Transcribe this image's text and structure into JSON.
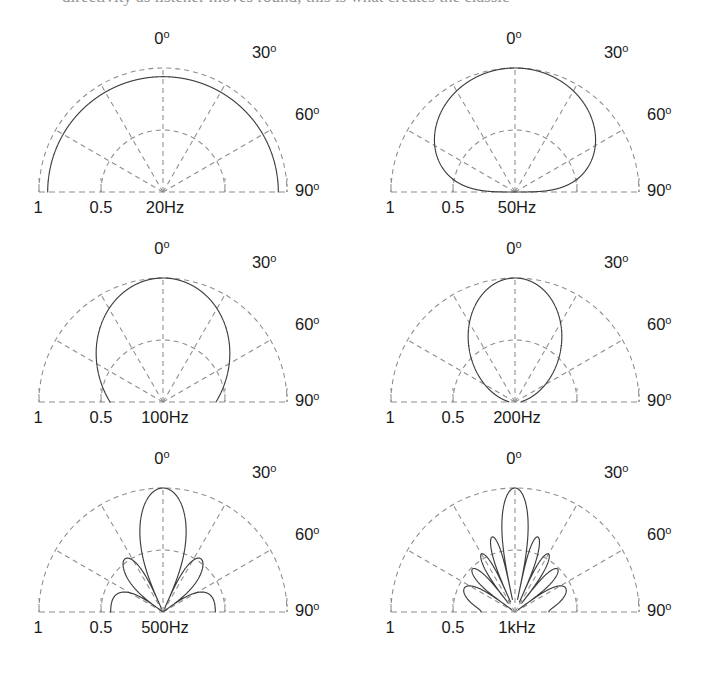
{
  "figure": {
    "title_sliver": "directivity as listener moves round; this is what creates the classic",
    "background": "#ffffff",
    "grid_color": "#8d8d8d",
    "trace_color": "#3d3d3d",
    "layout": {
      "columns": 2,
      "rows": 3,
      "panel_width": 352,
      "panel_height": 215
    }
  },
  "axis": {
    "angle_labels": [
      {
        "value": "0",
        "degree_mark": "o",
        "angle_deg": 0
      },
      {
        "value": "30",
        "degree_mark": "o",
        "angle_deg": 30
      },
      {
        "value": "60",
        "degree_mark": "o",
        "angle_deg": 60
      },
      {
        "value": "90",
        "degree_mark": "o",
        "angle_deg": 90
      }
    ],
    "radius_labels": [
      {
        "text": "1",
        "radius": 1.0
      },
      {
        "text": "0.5",
        "radius": 0.5
      }
    ],
    "radial_rings": [
      0.5,
      1.0
    ],
    "radial_rays_deg": [
      -60,
      -30,
      0,
      30,
      60
    ],
    "grid": "on",
    "radius_range": [
      0,
      1
    ]
  },
  "chart_data": {
    "type": "line",
    "xlabel": "Off-axis angle (degrees)",
    "ylabel": "Normalised pressure",
    "projection": "polar-half",
    "theta_range_deg": [
      -90,
      90
    ],
    "r_range": [
      0,
      1
    ],
    "panels": [
      {
        "id": "p20",
        "freq_label": "20Hz",
        "frequency_hz": 20,
        "ka": 0.62,
        "description": "Essentially omnidirectional: near-constant radius ~0.93 across the whole half-plane.",
        "lobe_count": 1,
        "main_lobe_width_deg": 180,
        "nulls_deg": [],
        "samples_deg": [
          -90,
          -75,
          -60,
          -45,
          -30,
          -15,
          0,
          15,
          30,
          45,
          60,
          75,
          90
        ],
        "samples_r": [
          0.93,
          0.93,
          0.93,
          0.93,
          0.93,
          0.93,
          0.93,
          0.93,
          0.93,
          0.93,
          0.93,
          0.93,
          0.93
        ]
      },
      {
        "id": "p50",
        "freq_label": "50Hz",
        "frequency_hz": 50,
        "ka": 1.55,
        "description": "One broad forward lobe reaching r=1 on axis, falling to zero at +/-90.",
        "lobe_count": 1,
        "main_lobe_width_deg": 120,
        "nulls_deg": [
          -90,
          90
        ],
        "samples_deg": [
          -90,
          -75,
          -60,
          -45,
          -30,
          -15,
          0,
          15,
          30,
          45,
          60,
          75,
          90
        ],
        "samples_r": [
          0.0,
          0.3,
          0.6,
          0.82,
          0.94,
          1.0,
          1.0,
          1.0,
          0.94,
          0.82,
          0.6,
          0.3,
          0.0
        ]
      },
      {
        "id": "p100",
        "freq_label": "100Hz",
        "frequency_hz": 100,
        "ka": 3.1,
        "description": "Narrow main lobe on axis plus one side lobe each side peaking near +/-70 degrees at r~0.62.",
        "lobe_count": 3,
        "main_lobe_width_deg": 40,
        "nulls_deg": [
          -45,
          45
        ],
        "side_lobe_peaks_deg": [
          -70,
          70
        ],
        "side_lobe_levels": [
          0.62,
          0.62
        ],
        "samples_deg": [
          -90,
          -75,
          -60,
          -45,
          -30,
          -15,
          0,
          15,
          30,
          45,
          60,
          75,
          90
        ],
        "samples_r": [
          0.4,
          0.62,
          0.55,
          0.03,
          0.3,
          0.86,
          1.0,
          0.86,
          0.3,
          0.03,
          0.55,
          0.62,
          0.4
        ]
      },
      {
        "id": "p200",
        "freq_label": "200Hz",
        "frequency_hz": 200,
        "ka": 6.2,
        "description": "Main lobe on axis, strong side lobes near +/-35 degrees reaching r~0.8, small lobes near +/-75 at r~0.35.",
        "lobe_count": 5,
        "main_lobe_width_deg": 22,
        "nulls_deg": [
          -55,
          -20,
          20,
          55
        ],
        "side_lobe_peaks_deg": [
          -75,
          -35,
          35,
          75
        ],
        "side_lobe_levels": [
          0.35,
          0.8,
          0.8,
          0.35
        ],
        "samples_deg": [
          -90,
          -75,
          -60,
          -45,
          -35,
          -20,
          -10,
          0,
          10,
          20,
          35,
          45,
          60,
          75,
          90
        ],
        "samples_r": [
          0.28,
          0.35,
          0.22,
          0.52,
          0.8,
          0.05,
          0.72,
          1.0,
          0.72,
          0.05,
          0.8,
          0.52,
          0.22,
          0.35,
          0.28
        ]
      },
      {
        "id": "p500",
        "freq_label": "500Hz",
        "frequency_hz": 500,
        "ka": 15.5,
        "description": "Fan of about eleven lobes; outer lobes near +/-75 degrees are the longest, reaching the r=1 grid.",
        "lobe_count": 11,
        "main_lobe_width_deg": 9,
        "side_lobe_peaks_deg": [
          -78,
          -57,
          -40,
          -26,
          -13,
          13,
          26,
          40,
          57,
          78
        ],
        "side_lobe_levels": [
          0.98,
          0.8,
          0.72,
          0.78,
          0.86,
          0.86,
          0.78,
          0.72,
          0.8,
          0.98
        ]
      },
      {
        "id": "p1k",
        "freq_label": "1kHz",
        "frequency_hz": 1000,
        "ka": 31.0,
        "description": "Dense fan of roughly twenty-three very narrow lobes covering the full half-plane.",
        "lobe_count": 23,
        "main_lobe_width_deg": 4.5,
        "side_lobe_peaks_deg": [
          -85,
          -77,
          -69,
          -61,
          -53,
          -45,
          -38,
          -30,
          -23,
          -15,
          -8,
          8,
          15,
          23,
          30,
          38,
          45,
          53,
          61,
          69,
          77,
          85
        ],
        "side_lobe_levels": [
          0.92,
          0.97,
          0.88,
          0.84,
          0.8,
          0.78,
          0.76,
          0.75,
          0.74,
          0.74,
          0.74,
          0.74,
          0.74,
          0.74,
          0.75,
          0.76,
          0.78,
          0.8,
          0.84,
          0.88,
          0.97,
          0.92
        ]
      }
    ]
  }
}
